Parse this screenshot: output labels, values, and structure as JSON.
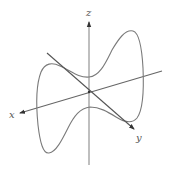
{
  "diagram": {
    "type": "3d-curve-with-axes",
    "axes": {
      "x": {
        "label": "x"
      },
      "y": {
        "label": "y"
      },
      "z": {
        "label": "z"
      }
    },
    "colors": {
      "curve": "#7a7a7a",
      "axis": "#555555",
      "background": "#ffffff"
    }
  }
}
